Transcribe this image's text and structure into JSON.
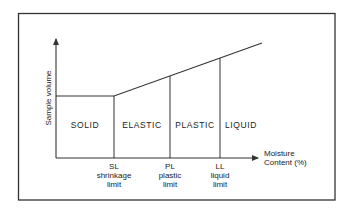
{
  "diagram": {
    "type": "phase-diagram",
    "y_axis_label": "Sample volume",
    "x_axis_label_line1": "Moisture",
    "x_axis_label_line2": "Content (%)",
    "regions": [
      {
        "label": "SOLID"
      },
      {
        "label": "ELASTIC"
      },
      {
        "label": "PLASTIC"
      },
      {
        "label": "LIQUID"
      }
    ],
    "limits": [
      {
        "abbr": "SL",
        "line1": "shrinkage",
        "line2": "limit"
      },
      {
        "abbr": "PL",
        "line1": "plastic",
        "line2": "limit"
      },
      {
        "abbr": "LL",
        "line1": "liquid",
        "line2": "limit"
      }
    ],
    "colors": {
      "line": "#333333",
      "frame": "#333333",
      "background": "#ffffff"
    }
  }
}
